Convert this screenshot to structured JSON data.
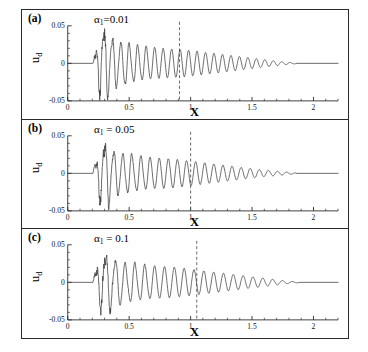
{
  "figure": {
    "background": "#ffffff",
    "line_color": "#3a3a3a",
    "axis_color": "#2a2a2a",
    "marker_color": "#555555"
  },
  "axes": {
    "xlabel": "X",
    "ylabel_main": "u",
    "ylabel_sub": "d",
    "xticks": [
      "0",
      "0.5",
      "1",
      "1.5",
      "2"
    ],
    "xtick_values": [
      0,
      0.5,
      1,
      1.5,
      2
    ],
    "yticks": [
      "0.05",
      "0",
      "-0.05"
    ],
    "ytick_values": [
      0.05,
      0,
      -0.05
    ],
    "xlim": [
      0,
      2.2
    ],
    "ylim": [
      -0.05,
      0.05
    ]
  },
  "panels": [
    {
      "label": "(a)",
      "alpha_symbol": "α",
      "alpha_sub": "1",
      "alpha_eq": "=0.01",
      "alpha_value": 0.01,
      "marker_x": 0.91
    },
    {
      "label": "(b)",
      "alpha_symbol": "α",
      "alpha_sub": "1",
      "alpha_eq": " = 0.05",
      "alpha_value": 0.05,
      "marker_x": 1.0
    },
    {
      "label": "(c)",
      "alpha_symbol": "α",
      "alpha_sub": "1",
      "alpha_eq": " = 0.1",
      "alpha_value": 0.1,
      "marker_x": 1.05
    }
  ],
  "chart_data": {
    "type": "line",
    "title": "",
    "xlabel": "X",
    "ylabel": "u_d",
    "xlim": [
      0,
      2.2
    ],
    "ylim": [
      -0.05,
      0.05
    ],
    "grid": false,
    "legend": "none",
    "series": [
      {
        "name": "(a) alpha_1 = 0.01",
        "onset_x": 0.21,
        "decay_end_x": 1.86,
        "peak_value": 0.047,
        "peak_x": 0.3,
        "trough_value": -0.041,
        "marker_x": 0.91,
        "envelope_x": [
          0.21,
          0.24,
          0.27,
          0.3,
          0.34,
          0.4,
          0.48,
          0.56,
          0.65,
          0.75,
          0.85,
          0.95,
          1.05,
          1.15,
          1.25,
          1.35,
          1.45,
          1.55,
          1.65,
          1.75,
          1.86,
          2.2
        ],
        "envelope_y": [
          0.004,
          0.028,
          0.036,
          0.047,
          0.034,
          0.03,
          0.026,
          0.024,
          0.022,
          0.02,
          0.019,
          0.018,
          0.016,
          0.014,
          0.012,
          0.01,
          0.008,
          0.006,
          0.004,
          0.002,
          0.0005,
          0.0
        ],
        "cycles_per_unit_x": 14.5
      },
      {
        "name": "(b) alpha_1 = 0.05",
        "onset_x": 0.21,
        "decay_end_x": 1.86,
        "peak_value": 0.044,
        "peak_x": 0.31,
        "trough_value": -0.048,
        "marker_x": 1.0,
        "envelope_x": [
          0.21,
          0.24,
          0.27,
          0.31,
          0.36,
          0.43,
          0.5,
          0.58,
          0.67,
          0.76,
          0.86,
          0.96,
          1.06,
          1.16,
          1.26,
          1.36,
          1.46,
          1.56,
          1.66,
          1.76,
          1.86,
          2.2
        ],
        "envelope_y": [
          0.005,
          0.026,
          0.032,
          0.044,
          0.03,
          0.027,
          0.025,
          0.023,
          0.021,
          0.02,
          0.019,
          0.017,
          0.015,
          0.013,
          0.011,
          0.009,
          0.007,
          0.005,
          0.0035,
          0.002,
          0.0005,
          0.0
        ],
        "cycles_per_unit_x": 13.5
      },
      {
        "name": "(c) alpha_1 = 0.1",
        "onset_x": 0.21,
        "decay_end_x": 1.88,
        "peak_value": 0.042,
        "peak_x": 0.3,
        "trough_value": -0.05,
        "marker_x": 1.05,
        "envelope_x": [
          0.21,
          0.24,
          0.27,
          0.3,
          0.35,
          0.42,
          0.5,
          0.58,
          0.67,
          0.77,
          0.87,
          0.97,
          1.07,
          1.17,
          1.27,
          1.37,
          1.47,
          1.57,
          1.67,
          1.77,
          1.88,
          2.2
        ],
        "envelope_y": [
          0.006,
          0.024,
          0.03,
          0.042,
          0.032,
          0.029,
          0.026,
          0.024,
          0.022,
          0.021,
          0.02,
          0.018,
          0.016,
          0.014,
          0.012,
          0.01,
          0.008,
          0.006,
          0.004,
          0.002,
          0.0005,
          0.0
        ],
        "cycles_per_unit_x": 12.5
      }
    ]
  }
}
